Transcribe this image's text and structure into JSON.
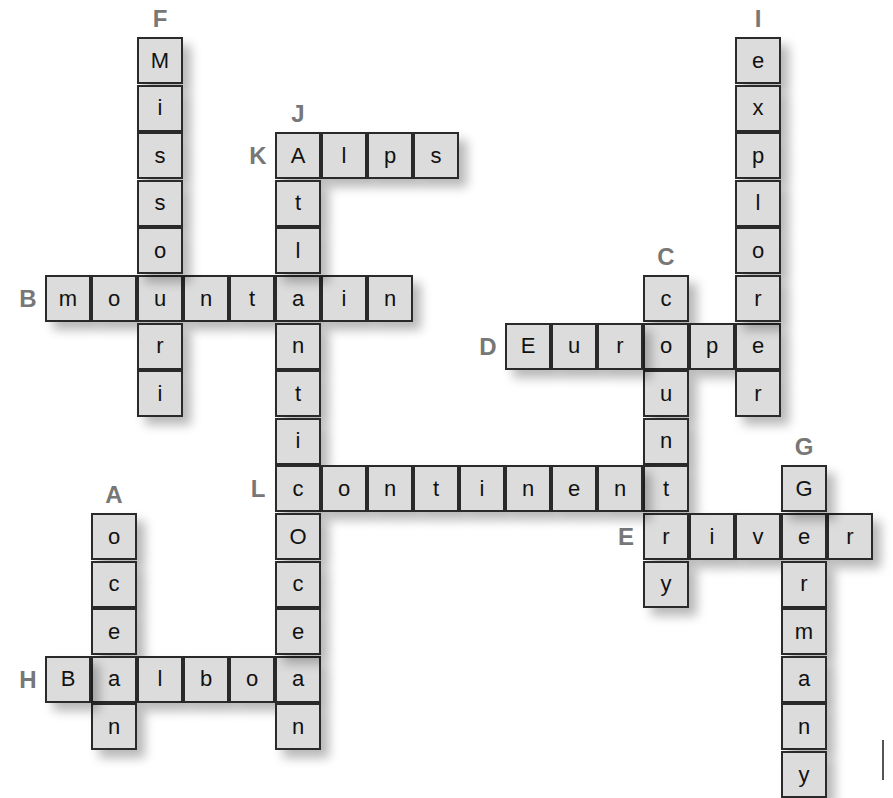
{
  "grid": {
    "origin_x": 45,
    "origin_y": 37,
    "cell_w": 46,
    "cell_h": 47.6
  },
  "colors": {
    "cell_bg": "#dcdcdc",
    "border": "#2a2a2a",
    "label": "#777777"
  },
  "words": [
    {
      "label": "A",
      "word": "ocean",
      "dir": "down",
      "row": 10,
      "col": 1
    },
    {
      "label": "B",
      "word": "mountain",
      "dir": "across",
      "row": 5,
      "col": 0
    },
    {
      "label": "C",
      "word": "country",
      "dir": "down",
      "row": 5,
      "col": 13
    },
    {
      "label": "D",
      "word": "Europe",
      "dir": "across",
      "row": 6,
      "col": 10
    },
    {
      "label": "E",
      "word": "river",
      "dir": "across",
      "row": 10,
      "col": 13
    },
    {
      "label": "F",
      "word": "Missouri",
      "dir": "down",
      "row": 0,
      "col": 2
    },
    {
      "label": "G",
      "word": "Germany",
      "dir": "down",
      "row": 9,
      "col": 16
    },
    {
      "label": "H",
      "word": "Balboa",
      "dir": "across",
      "row": 13,
      "col": 0
    },
    {
      "label": "I",
      "word": "explorer",
      "dir": "down",
      "row": 0,
      "col": 15
    },
    {
      "label": "J",
      "word": "AtlanticOcean",
      "dir": "down",
      "row": 2,
      "col": 5
    },
    {
      "label": "K",
      "word": "Alps",
      "dir": "across",
      "row": 2,
      "col": 5
    },
    {
      "label": "L",
      "word": "continent",
      "dir": "across",
      "row": 9,
      "col": 5
    }
  ]
}
